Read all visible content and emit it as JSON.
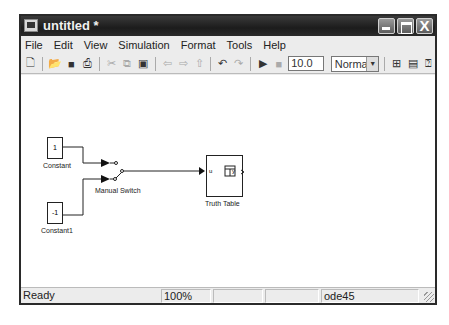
{
  "window": {
    "title": "untitled *",
    "controls": {
      "minimize": "_",
      "maximize": "□",
      "close": "X"
    }
  },
  "menubar": {
    "items": [
      {
        "label": "File",
        "mnemonic": "F"
      },
      {
        "label": "Edit",
        "mnemonic": "E"
      },
      {
        "label": "View",
        "mnemonic": "V"
      },
      {
        "label": "Simulation",
        "mnemonic": "S"
      },
      {
        "label": "Format",
        "mnemonic": "o"
      },
      {
        "label": "Tools",
        "mnemonic": "T"
      },
      {
        "label": "Help",
        "mnemonic": "H"
      }
    ]
  },
  "toolbar": {
    "icons": [
      "new-icon",
      "open-icon",
      "save-icon",
      "print-icon",
      "cut-icon",
      "copy-icon",
      "paste-icon",
      "back-icon",
      "forward-icon",
      "up-icon",
      "undo-icon",
      "redo-icon",
      "start-icon",
      "stop-icon"
    ],
    "stop_time": "10.0",
    "sim_mode": "Normal",
    "right_icons": [
      "build-icon",
      "library-browser-icon",
      "model-explorer-icon"
    ]
  },
  "diagram": {
    "blocks": [
      {
        "name": "Constant",
        "value": "1"
      },
      {
        "name": "Constant1",
        "value": "-1"
      },
      {
        "name": "Manual Switch"
      },
      {
        "name": "Truth Table",
        "in_port": "u",
        "out_port": "y"
      }
    ]
  },
  "statusbar": {
    "status": "Ready",
    "zoom": "100%",
    "cell3": "",
    "cell4": "",
    "solver": "ode45"
  }
}
